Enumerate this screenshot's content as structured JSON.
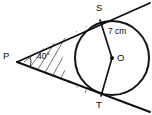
{
  "figure": {
    "type": "geometry-diagram",
    "background_color": "#ffffff",
    "line_color": "#101010",
    "hatch_color": "#5a5a5a",
    "labels": {
      "external_point": "P",
      "tangent_point_top": "S",
      "tangent_point_bottom": "T",
      "centre": "O",
      "radius_measure": "7 cm",
      "angle_measure": "40°"
    },
    "points": {
      "P": {
        "x": 17,
        "y": 62
      },
      "S": {
        "x": 100,
        "y": 20
      },
      "T": {
        "x": 101,
        "y": 96
      },
      "O": {
        "x": 112,
        "y": 58
      }
    },
    "circle": {
      "centre_x": 112,
      "centre_y": 58,
      "radius": 37
    },
    "tangent_top": {
      "x1": 17,
      "y1": 62,
      "x2": 150,
      "y2": 3
    },
    "tangent_bottom": {
      "x1": 17,
      "y1": 62,
      "x2": 150,
      "y2": 112
    },
    "angle_arc_radius": 14,
    "hatch_lines": [
      {
        "x1": 24,
        "y1": 62,
        "x2": 33,
        "y2": 55
      },
      {
        "x1": 28,
        "y1": 70,
        "x2": 44,
        "y2": 48
      },
      {
        "x1": 33,
        "y1": 77,
        "x2": 55,
        "y2": 42
      },
      {
        "x1": 39,
        "y1": 83,
        "x2": 66,
        "y2": 36
      },
      {
        "x1": 46,
        "y1": 88,
        "x2": 77,
        "y2": 31
      },
      {
        "x1": 54,
        "y1": 92,
        "x2": 87,
        "y2": 26
      },
      {
        "x1": 63,
        "y1": 95,
        "x2": 97,
        "y2": 22
      },
      {
        "x1": 73,
        "y1": 97,
        "x2": 104,
        "y2": 20
      },
      {
        "x1": 83,
        "y1": 99,
        "x2": 110,
        "y2": 21
      }
    ]
  }
}
